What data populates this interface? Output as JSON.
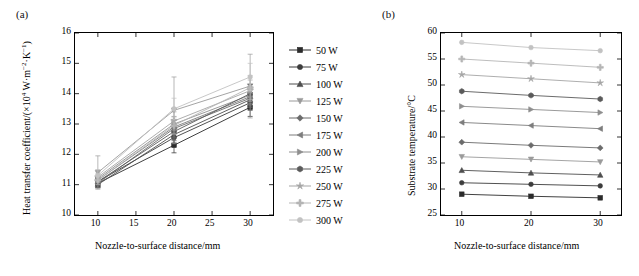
{
  "figure": {
    "panel_a_label": "(a)",
    "panel_b_label": "(b)"
  },
  "legend": {
    "items": [
      {
        "label": "50 W",
        "color": "#2b2b2b",
        "marker": "square"
      },
      {
        "label": "75 W",
        "color": "#3c3c3c",
        "marker": "circle"
      },
      {
        "label": "100 W",
        "color": "#4e4e4e",
        "marker": "triangle"
      },
      {
        "label": "125 W",
        "color": "#9a9a9a",
        "marker": "triangle-down"
      },
      {
        "label": "150 W",
        "color": "#6b6b6b",
        "marker": "diamond"
      },
      {
        "label": "175 W",
        "color": "#7d7d7d",
        "marker": "left-triangle"
      },
      {
        "label": "200 W",
        "color": "#8e8e8e",
        "marker": "right-triangle"
      },
      {
        "label": "225 W",
        "color": "#5a5a5a",
        "marker": "hexagon"
      },
      {
        "label": "250 W",
        "color": "#a5a5a5",
        "marker": "star"
      },
      {
        "label": "275 W",
        "color": "#b5b5b5",
        "marker": "plus"
      },
      {
        "label": "300 W",
        "color": "#c2c2c2",
        "marker": "circle"
      }
    ]
  },
  "chart_data": [
    {
      "type": "line",
      "panel": "(a)",
      "title": "",
      "xlabel": "Nozzle-to-surface distance/mm",
      "ylabel": "Heat transfer coefficient/(×10⁴ W·m⁻²·K⁻¹)",
      "x": [
        10,
        20,
        30
      ],
      "xlim": [
        7,
        33
      ],
      "ylim": [
        10,
        16
      ],
      "xticks": [
        10,
        15,
        20,
        25,
        30
      ],
      "yticks": [
        10,
        11,
        12,
        13,
        14,
        15,
        16
      ],
      "grid": false,
      "errorbars": true,
      "series": [
        {
          "name": "50 W",
          "values": [
            11.05,
            12.3,
            13.55
          ],
          "errors": [
            0.15,
            0.25,
            0.3
          ]
        },
        {
          "name": "75 W",
          "values": [
            11.1,
            12.55,
            13.7
          ],
          "errors": [
            0.12,
            0.2,
            0.25
          ]
        },
        {
          "name": "100 W",
          "values": [
            11.0,
            12.65,
            13.8
          ],
          "errors": [
            0.1,
            0.2,
            0.22
          ]
        },
        {
          "name": "125 W",
          "values": [
            11.4,
            13.45,
            14.25
          ],
          "errors": [
            0.55,
            1.1,
            1.05
          ]
        },
        {
          "name": "150 W",
          "values": [
            11.05,
            12.85,
            13.85
          ],
          "errors": [
            0.15,
            0.3,
            0.3
          ]
        },
        {
          "name": "175 W",
          "values": [
            11.15,
            12.9,
            13.9
          ],
          "errors": [
            0.12,
            0.25,
            0.28
          ]
        },
        {
          "name": "200 W",
          "values": [
            11.2,
            13.0,
            13.95
          ],
          "errors": [
            0.15,
            0.25,
            0.28
          ]
        },
        {
          "name": "225 W",
          "values": [
            11.1,
            12.75,
            14.0
          ],
          "errors": [
            0.12,
            0.22,
            0.3
          ]
        },
        {
          "name": "250 W",
          "values": [
            11.25,
            13.1,
            14.1
          ],
          "errors": [
            0.18,
            0.3,
            0.35
          ]
        },
        {
          "name": "275 W",
          "values": [
            11.15,
            12.95,
            14.2
          ],
          "errors": [
            0.15,
            0.28,
            0.4
          ]
        },
        {
          "name": "300 W",
          "values": [
            11.3,
            13.5,
            14.55
          ],
          "errors": [
            0.2,
            0.35,
            0.45
          ]
        }
      ]
    },
    {
      "type": "line",
      "panel": "(b)",
      "title": "",
      "xlabel": "Nozzle-to-surface distance/mm",
      "ylabel": "Substrate temperature/°C",
      "x": [
        10,
        20,
        30
      ],
      "xlim": [
        7,
        33
      ],
      "ylim": [
        25,
        60
      ],
      "xticks": [
        10,
        20,
        30
      ],
      "yticks": [
        25,
        30,
        35,
        40,
        45,
        50,
        55,
        60
      ],
      "grid": false,
      "errorbars": false,
      "series": [
        {
          "name": "50 W",
          "values": [
            29.0,
            28.6,
            28.3
          ]
        },
        {
          "name": "75 W",
          "values": [
            31.2,
            30.9,
            30.6
          ]
        },
        {
          "name": "100 W",
          "values": [
            33.6,
            33.1,
            32.7
          ]
        },
        {
          "name": "125 W",
          "values": [
            36.2,
            35.7,
            35.2
          ]
        },
        {
          "name": "150 W",
          "values": [
            39.0,
            38.4,
            37.9
          ]
        },
        {
          "name": "175 W",
          "values": [
            42.8,
            42.2,
            41.6
          ]
        },
        {
          "name": "200 W",
          "values": [
            45.9,
            45.3,
            44.7
          ]
        },
        {
          "name": "225 W",
          "values": [
            48.8,
            48.0,
            47.3
          ]
        },
        {
          "name": "250 W",
          "values": [
            52.0,
            51.2,
            50.4
          ]
        },
        {
          "name": "275 W",
          "values": [
            55.0,
            54.2,
            53.4
          ]
        },
        {
          "name": "300 W",
          "values": [
            58.2,
            57.2,
            56.6
          ]
        }
      ]
    }
  ]
}
